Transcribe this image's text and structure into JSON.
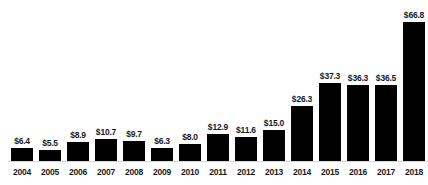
{
  "chart_data": {
    "type": "bar",
    "title": "",
    "subtitle": "",
    "xlabel": "",
    "ylabel": "",
    "grid": false,
    "legend": null,
    "axis": {
      "x_range": [
        "2004",
        "2018"
      ],
      "y_min": 0,
      "y_max": 66.8,
      "y_axis_visible": false,
      "x_axis_visible": true
    },
    "value_prefix": "$",
    "categories": [
      "2004",
      "2005",
      "2006",
      "2007",
      "2008",
      "2009",
      "2010",
      "2011",
      "2012",
      "2013",
      "2014",
      "2015",
      "2016",
      "2017",
      "2018"
    ],
    "values": [
      6.4,
      5.5,
      8.9,
      10.7,
      9.7,
      6.3,
      8.0,
      12.9,
      11.6,
      15.0,
      26.3,
      37.3,
      36.3,
      36.5,
      66.8
    ],
    "data_labels": [
      "$6.4",
      "$5.5",
      "$8.9",
      "$10.7",
      "$9.7",
      "$6.3",
      "$8.0",
      "$12.9",
      "$11.6",
      "$15.0",
      "$26.3",
      "$37.3",
      "$36.3",
      "$36.5",
      "$66.8"
    ],
    "bar_color": "#000000",
    "background_color": "#ffffff",
    "label_color": "#1a1a1a",
    "axis_line_color": "#d9d9d9"
  }
}
